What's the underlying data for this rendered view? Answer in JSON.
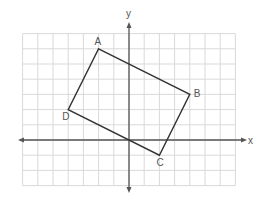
{
  "diagram": {
    "type": "coordinate-plane-quadrilateral",
    "grid": {
      "x_min": -7,
      "x_max": 7,
      "y_min": -3,
      "y_max": 7,
      "cell_px": 15.2,
      "origin_px": [
        129,
        140
      ],
      "line_color": "#d9d9d9",
      "axis_color": "#555555"
    },
    "axes": {
      "x_label": "x",
      "y_label": "y"
    },
    "polygon": {
      "stroke": "#333333",
      "vertices": [
        {
          "name": "A",
          "x": -2,
          "y": 6
        },
        {
          "name": "B",
          "x": 4,
          "y": 3
        },
        {
          "name": "C",
          "x": 2,
          "y": -1
        },
        {
          "name": "D",
          "x": -4,
          "y": 2
        }
      ]
    }
  }
}
